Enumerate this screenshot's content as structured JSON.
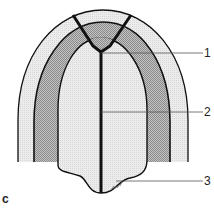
{
  "figure": {
    "panel_label": "c",
    "labels": [
      {
        "id": "1",
        "text": "1",
        "target": "apex-junction"
      },
      {
        "id": "2",
        "text": "2",
        "target": "central-axis"
      },
      {
        "id": "3",
        "text": "3",
        "target": "base-tip"
      }
    ]
  },
  "colors": {
    "outline": "#111111",
    "light_fill": "#e6e6e6",
    "dark_fill": "#a8a8a8",
    "apex_fill": "#9a9a9a",
    "leader": "#555555"
  }
}
